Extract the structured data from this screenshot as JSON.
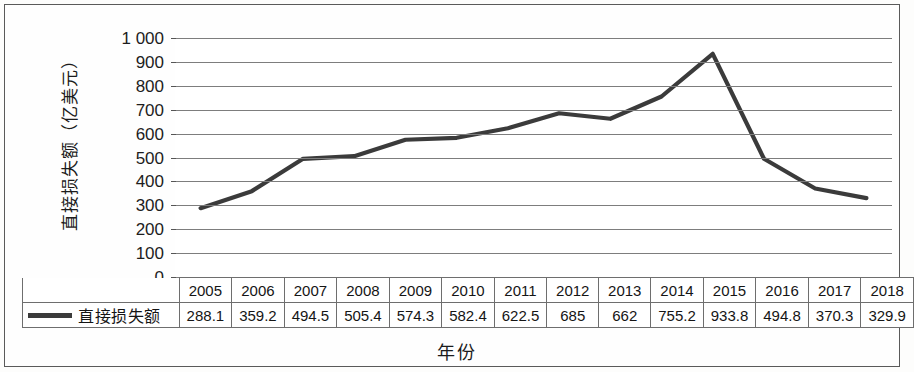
{
  "chart_data": {
    "type": "line",
    "title": "",
    "xlabel": "年份",
    "ylabel": "直接损失额（亿美元）",
    "categories": [
      "2005",
      "2006",
      "2007",
      "2008",
      "2009",
      "2010",
      "2011",
      "2012",
      "2013",
      "2014",
      "2015",
      "2016",
      "2017",
      "2018"
    ],
    "series": [
      {
        "name": "直接损失额",
        "values": [
          288.1,
          359.2,
          494.5,
          505.4,
          574.3,
          582.4,
          622.5,
          685,
          662,
          755.2,
          933.8,
          494.8,
          370.3,
          329.9
        ],
        "value_labels": [
          "288.1",
          "359.2",
          "494.5",
          "505.4",
          "574.3",
          "582.4",
          "622.5",
          "685",
          "662",
          "755.2",
          "933.8",
          "494.8",
          "370.3",
          "329.9"
        ],
        "color": "#3b3b3b"
      }
    ],
    "ylim": [
      0,
      1000
    ],
    "ytick_values": [
      1000,
      900,
      800,
      700,
      600,
      500,
      400,
      300,
      200,
      100,
      0
    ],
    "ytick_labels": [
      "1 000",
      "900",
      "800",
      "700",
      "600",
      "500",
      "400",
      "300",
      "200",
      "100",
      "0"
    ],
    "grid": true,
    "grid_color": "#7d7d7d",
    "legend_position": "data-table-row",
    "has_data_table": true
  },
  "legend": {
    "series_label": "直接损失额",
    "swatch_color": "#3b3b3b"
  },
  "axis": {
    "y_title": "直接损失额（亿美元）",
    "x_title": "年份"
  }
}
